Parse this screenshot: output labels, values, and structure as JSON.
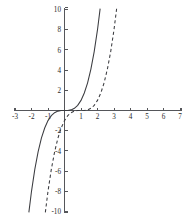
{
  "chart_data": {
    "type": "line",
    "title": "",
    "subtitle": "",
    "xlabel": "",
    "ylabel": "",
    "xlim": [
      -3,
      7
    ],
    "ylim": [
      -10,
      10
    ],
    "grid": false,
    "legend": "none",
    "x_ticks": [
      -3,
      -2,
      -1,
      1,
      2,
      3,
      4,
      5,
      6,
      7
    ],
    "x_tick_labels": [
      "-3",
      "-2",
      "-1",
      "1",
      "2",
      "3",
      "4",
      "5",
      "6",
      "7"
    ],
    "y_ticks": [
      -10,
      -8,
      -6,
      -4,
      -2,
      2,
      4,
      6,
      8,
      10
    ],
    "y_tick_labels": [
      "-10",
      "-8",
      "-6",
      "-4",
      "-2",
      "2",
      "4",
      "6",
      "8",
      "10"
    ],
    "axes_style": "centered-cross",
    "series": [
      {
        "name": "solid-cubic",
        "style": "solid",
        "color": "#3b3c40",
        "expression": "y = x^3",
        "x": [
          -2.16,
          -2.0,
          -1.8,
          -1.6,
          -1.4,
          -1.2,
          -1.0,
          -0.8,
          -0.6,
          -0.4,
          -0.2,
          0.0,
          0.2,
          0.4,
          0.6,
          0.8,
          1.0,
          1.2,
          1.4,
          1.6,
          1.8,
          2.0,
          2.16
        ],
        "values": [
          -10.08,
          -8.0,
          -5.83,
          -4.1,
          -2.74,
          -1.73,
          -1.0,
          -0.51,
          -0.22,
          -0.06,
          -0.01,
          0.0,
          0.01,
          0.06,
          0.22,
          0.51,
          1.0,
          1.73,
          2.74,
          4.1,
          5.83,
          8.0,
          10.08
        ]
      },
      {
        "name": "dashed-cubic-shifted",
        "style": "dashed",
        "color": "#3b3c40",
        "expression": "y = (x - 1)^3",
        "x": [
          -1.16,
          -1.0,
          -0.8,
          -0.6,
          -0.4,
          -0.2,
          0.0,
          0.2,
          0.4,
          0.6,
          0.8,
          1.0,
          1.2,
          1.4,
          1.6,
          1.8,
          2.0,
          2.2,
          2.4,
          2.6,
          2.8,
          3.0,
          3.16
        ],
        "values": [
          -10.08,
          -8.0,
          -5.83,
          -4.1,
          -2.74,
          -1.73,
          -1.0,
          -0.51,
          -0.22,
          -0.06,
          -0.01,
          0.0,
          0.01,
          0.06,
          0.22,
          0.51,
          1.0,
          1.73,
          2.74,
          4.1,
          5.83,
          8.0,
          10.08
        ]
      }
    ]
  }
}
